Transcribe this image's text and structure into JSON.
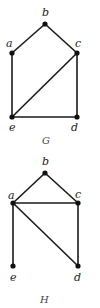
{
  "graphs": [
    {
      "name": "G",
      "caption": "G",
      "nodes": [
        {
          "id": "a",
          "label": "a",
          "x": 12,
          "y": 53,
          "lx": 6,
          "ly": 47
        },
        {
          "id": "b",
          "label": "b",
          "x": 45,
          "y": 24,
          "lx": 42,
          "ly": 16
        },
        {
          "id": "c",
          "label": "c",
          "x": 77,
          "y": 53,
          "lx": 75,
          "ly": 47
        },
        {
          "id": "d",
          "label": "d",
          "x": 77,
          "y": 117,
          "lx": 71,
          "ly": 131
        },
        {
          "id": "e",
          "label": "e",
          "x": 12,
          "y": 117,
          "lx": 9,
          "ly": 131
        }
      ],
      "edges": [
        [
          "a",
          "b"
        ],
        [
          "b",
          "c"
        ],
        [
          "a",
          "e"
        ],
        [
          "c",
          "d"
        ],
        [
          "e",
          "d"
        ],
        [
          "e",
          "c"
        ]
      ]
    },
    {
      "name": "H",
      "caption": "H",
      "nodes": [
        {
          "id": "a",
          "label": "a",
          "x": 13,
          "y": 203,
          "lx": 8,
          "ly": 199
        },
        {
          "id": "b",
          "label": "b",
          "x": 45,
          "y": 173,
          "lx": 42,
          "ly": 165
        },
        {
          "id": "c",
          "label": "c",
          "x": 78,
          "y": 203,
          "lx": 75,
          "ly": 198
        },
        {
          "id": "d",
          "label": "d",
          "x": 78,
          "y": 266,
          "lx": 74,
          "ly": 281
        },
        {
          "id": "e",
          "label": "e",
          "x": 13,
          "y": 266,
          "lx": 10,
          "ly": 281
        }
      ],
      "edges": [
        [
          "a",
          "b"
        ],
        [
          "b",
          "c"
        ],
        [
          "a",
          "c"
        ],
        [
          "a",
          "e"
        ],
        [
          "a",
          "d"
        ],
        [
          "c",
          "d"
        ]
      ]
    }
  ],
  "captions": {
    "G": {
      "text": "G",
      "x": 42,
      "y": 144
    },
    "H": {
      "text": "H",
      "x": 40,
      "y": 303
    }
  }
}
